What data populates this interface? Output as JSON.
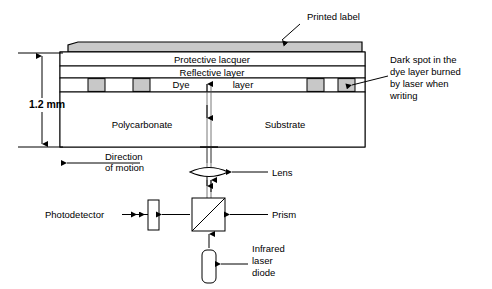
{
  "diagram": {
    "colors": {
      "gray_fill": "#c8c8c8",
      "line": "#000000",
      "background": "#ffffff"
    },
    "disc": {
      "layers": [
        {
          "id": "protective-lacquer",
          "label": "Protective lacquer"
        },
        {
          "id": "reflective-layer",
          "label": "Reflective layer"
        },
        {
          "id": "dye-layer-left",
          "label": "Dye"
        },
        {
          "id": "dye-layer-right",
          "label": "layer"
        },
        {
          "id": "polycarbonate",
          "label": "Polycarbonate"
        },
        {
          "id": "substrate",
          "label": "Substrate"
        }
      ],
      "thickness_label": "1.2 mm"
    },
    "callouts": [
      {
        "id": "printed-label",
        "text": "Printed label"
      },
      {
        "id": "dark-spot",
        "lines": [
          "Dark spot in the",
          "dye layer burned",
          "by laser when",
          "writing"
        ]
      },
      {
        "id": "direction-of-motion",
        "lines": [
          "Direction",
          "of motion"
        ]
      }
    ],
    "optics": [
      {
        "id": "lens",
        "label": "Lens"
      },
      {
        "id": "prism",
        "label": "Prism"
      },
      {
        "id": "photodetector",
        "label": "Photodetector"
      },
      {
        "id": "infrared-laser-diode",
        "lines": [
          "Infrared",
          "laser",
          "diode"
        ]
      }
    ]
  }
}
